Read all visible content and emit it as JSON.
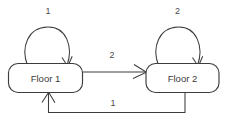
{
  "diagram": {
    "type": "state-transition-diagram",
    "background_color": "#ffffff",
    "stroke_color": "#3d3d3d",
    "text_color": "#3a3a3a",
    "nodes": [
      {
        "id": "floor1",
        "label": "Floor 1"
      },
      {
        "id": "floor2",
        "label": "Floor 2"
      }
    ],
    "edges": [
      {
        "id": "self-loop-floor1",
        "from": "floor1",
        "to": "floor1",
        "label": "1"
      },
      {
        "id": "self-loop-floor2",
        "from": "floor2",
        "to": "floor2",
        "label": "2"
      },
      {
        "id": "floor1-to-floor2",
        "from": "floor1",
        "to": "floor2",
        "label": "2"
      },
      {
        "id": "floor2-to-floor1",
        "from": "floor2",
        "to": "floor1",
        "label": "1"
      }
    ]
  }
}
